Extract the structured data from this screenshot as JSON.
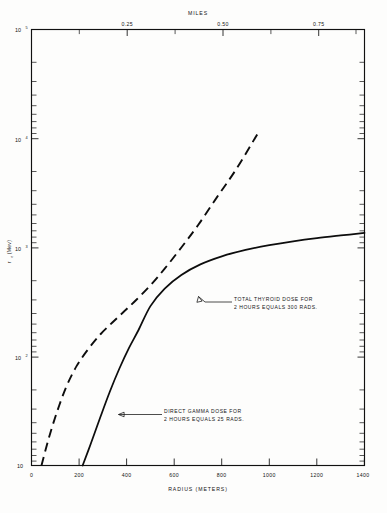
{
  "figure": {
    "background_color": "#fdfdfc",
    "ink_color": "#0d0d0d"
  },
  "chart_data": {
    "type": "line",
    "title": "",
    "xlabel": "RADIUS (METERS)",
    "ylabel": "r₀ (Mev)",
    "top_axis_label": "MILES",
    "xlim": [
      0,
      1400
    ],
    "ylim": [
      10,
      100000
    ],
    "yscale": "log",
    "xscale": "linear",
    "grid": false,
    "legend_position": "inline-annotations",
    "x_ticks": [
      0,
      200,
      400,
      600,
      800,
      1000,
      1200,
      1400
    ],
    "x_tick_labels": [
      "0",
      "200",
      "400",
      "600",
      "800",
      "1000",
      "1200",
      "1400"
    ],
    "x_minor_ticks": [
      100,
      300,
      500,
      700,
      900,
      1100,
      1300
    ],
    "top_ticks_miles": [
      0.25,
      0.5,
      0.75
    ],
    "top_tick_labels": [
      "0.25",
      "0.50",
      "0.75"
    ],
    "top_ticks_meters": [
      402.3,
      804.7,
      1207.0
    ],
    "top_minor_ticks_miles": [
      0.125,
      0.375,
      0.625,
      0.875
    ],
    "y_decade_labels": [
      "10",
      "10²",
      "10³",
      "10⁴",
      "10⁵"
    ],
    "y_decade_values": [
      10,
      100,
      1000,
      10000,
      100000
    ],
    "series": [
      {
        "name": "DIRECT GAMMA DOSE FOR 2 HOURS EQUALS 25 RADS.",
        "style": "solid",
        "x": [
          215,
          250,
          290,
          330,
          370,
          410,
          450,
          500,
          560,
          630,
          710,
          800,
          900,
          1000,
          1100,
          1200,
          1300,
          1400
        ],
        "y": [
          10,
          16,
          28,
          48,
          78,
          120,
          175,
          290,
          420,
          560,
          700,
          830,
          950,
          1050,
          1140,
          1220,
          1290,
          1360
        ]
      },
      {
        "name": "TOTAL THYROID DOSE FOR 2 HOURS EQUALS 300 RADS.",
        "style": "dashed",
        "x": [
          42,
          70,
          105,
          145,
          190,
          240,
          290,
          340,
          390,
          440,
          500,
          560,
          630,
          700,
          780,
          860,
          950
        ],
        "y": [
          10,
          17,
          30,
          52,
          82,
          118,
          160,
          205,
          260,
          330,
          450,
          640,
          1000,
          1600,
          2900,
          5200,
          11000
        ]
      }
    ],
    "annotations": [
      {
        "text_line1": "TOTAL  THYROID  DOSE  FOR",
        "text_line2": "2  HOURS  EQUALS  300  RADS.",
        "anchor_x": 700,
        "anchor_y": 780
      },
      {
        "text_line1": "DIRECT  GAMMA  DOSE  FOR",
        "text_line2": "2  HOURS  EQUALS  25  RADS.",
        "anchor_x": 390,
        "anchor_y": 105
      }
    ]
  }
}
